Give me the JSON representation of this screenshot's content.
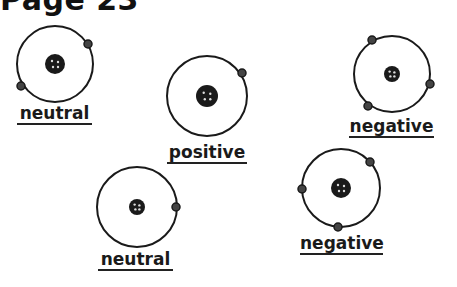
{
  "page": {
    "title": "Page 23"
  },
  "atoms": [
    {
      "label": "neutral",
      "cx": 55,
      "cy": 64,
      "r": 38,
      "nucleus_r": 10,
      "electrons": [
        [
          88,
          44
        ],
        [
          21,
          86
        ]
      ],
      "label_x": 17,
      "label_y": 104,
      "label_w": 75
    },
    {
      "label": "positive",
      "cx": 207,
      "cy": 96,
      "r": 40,
      "nucleus_r": 11,
      "electrons": [
        [
          242,
          73
        ]
      ],
      "label_x": 167,
      "label_y": 143,
      "label_w": 80
    },
    {
      "label": "negative",
      "cx": 392,
      "cy": 74,
      "r": 38,
      "nucleus_r": 8,
      "electrons": [
        [
          372,
          40
        ],
        [
          430,
          84
        ],
        [
          368,
          106
        ]
      ],
      "label_x": 349,
      "label_y": 117,
      "label_w": 85
    },
    {
      "label": "neutral",
      "cx": 137,
      "cy": 207,
      "r": 40,
      "nucleus_r": 8,
      "electrons": [
        [
          176,
          207
        ]
      ],
      "label_x": 98,
      "label_y": 250,
      "label_w": 75
    },
    {
      "label": "negative",
      "cx": 341,
      "cy": 188,
      "r": 39,
      "nucleus_r": 10,
      "electrons": [
        [
          370,
          162
        ],
        [
          302,
          189
        ],
        [
          338,
          227
        ]
      ],
      "label_x": 300,
      "label_y": 234,
      "label_w": 83
    }
  ],
  "colors": {
    "ink": "#1a1a1a",
    "background": "#ffffff"
  }
}
